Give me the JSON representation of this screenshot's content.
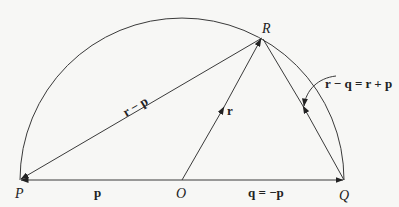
{
  "diagram": {
    "title": "",
    "points": {
      "P": {
        "label": "P",
        "x": 20,
        "y": 180
      },
      "O": {
        "label": "O",
        "x": 182,
        "y": 180
      },
      "Q": {
        "label": "Q",
        "x": 344,
        "y": 180
      },
      "R": {
        "label": "R",
        "x": 262,
        "y": 38
      }
    },
    "vectors": {
      "p": "p",
      "q": "q = −p",
      "r": "r",
      "r_minus_p": "r − p",
      "r_minus_q": "r − q = r + p"
    },
    "colors": {
      "stroke": "#3a3a3a",
      "background": "#f7f7f5",
      "text": "#222222"
    }
  }
}
